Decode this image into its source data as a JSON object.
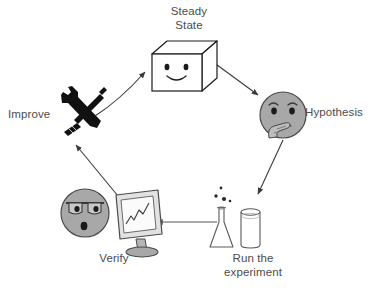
{
  "diagram": {
    "background_color": "#ffffff",
    "label_color": "#4c4c4c",
    "nodes": [
      {
        "id": "steady-state",
        "label": "Steady\nState",
        "icon": "smiling-cube-icon",
        "icon_description": "white 3D cube with smiley face on front",
        "position": "top-center"
      },
      {
        "id": "hypothesis",
        "label": "Hypothesis",
        "icon": "thinking-face-icon",
        "icon_description": "gray round face with hand on chin",
        "position": "right"
      },
      {
        "id": "run-the-experiment",
        "label": "Run the\nexperiment",
        "icon": "flask-and-beaker-icon",
        "icon_description": "erlenmeyer flask with bubbles next to a beaker",
        "position": "bottom-right"
      },
      {
        "id": "verify",
        "label": "Verify",
        "icon": "monitor-chart-icon",
        "icon_description": "gray surprised face with heavy brows beside a monitor showing a rising line chart",
        "position": "bottom-left"
      },
      {
        "id": "improve",
        "label": "Improve",
        "icon": "crossed-tools-icon",
        "icon_description": "black crossed wrench and screwdriver",
        "position": "left"
      }
    ],
    "arrows": [
      {
        "id": "arrow-improve-to-steady-state",
        "from": "improve",
        "to": "steady-state"
      },
      {
        "id": "arrow-steady-state-to-hypothesis",
        "from": "steady-state",
        "to": "hypothesis"
      },
      {
        "id": "arrow-hypothesis-to-experiment",
        "from": "hypothesis",
        "to": "run-the-experiment"
      },
      {
        "id": "arrow-experiment-to-verify",
        "from": "run-the-experiment",
        "to": "verify"
      },
      {
        "id": "arrow-verify-to-improve",
        "from": "verify",
        "to": "improve"
      }
    ]
  }
}
